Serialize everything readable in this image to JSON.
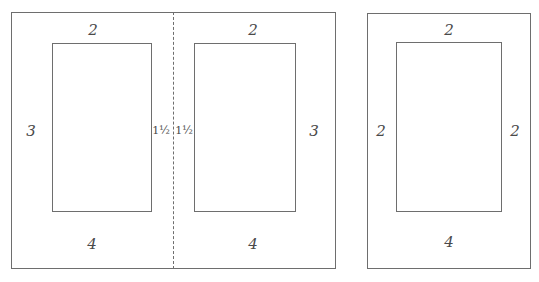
{
  "diagram": {
    "spread": {
      "left_page": {
        "margins": {
          "top": "2",
          "outer": "3",
          "inner": "1½",
          "bottom": "4"
        }
      },
      "right_page": {
        "margins": {
          "top": "2",
          "inner": "1½",
          "outer": "3",
          "bottom": "4"
        }
      },
      "fold_line": "dashed"
    },
    "single_page": {
      "margins": {
        "top": "2",
        "left": "2",
        "right": "2",
        "bottom": "4"
      }
    }
  }
}
